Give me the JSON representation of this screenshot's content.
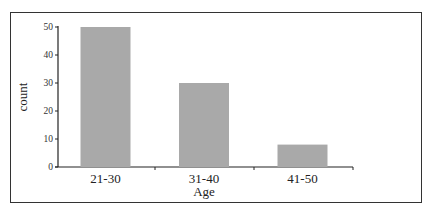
{
  "chart_data": {
    "type": "bar",
    "title": "",
    "xlabel": "Age",
    "ylabel": "count",
    "categories": [
      "21-30",
      "31-40",
      "41-50"
    ],
    "values": [
      50,
      30,
      8
    ],
    "ylim": [
      0,
      50
    ],
    "yticks": [
      0,
      10,
      20,
      30,
      40,
      50
    ],
    "grid": false,
    "legend": null,
    "bar_color": "#a9a9a9"
  }
}
